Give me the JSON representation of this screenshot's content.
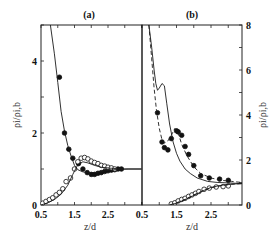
{
  "chart_data": [
    {
      "type": "scatter",
      "panel": "(a)",
      "title": "(a)",
      "xlabel": "z/d",
      "ylabel": "ρi/ρi,b",
      "xlim": [
        0.5,
        3.5
      ],
      "ylim": [
        0,
        5
      ],
      "xticks": [
        "0.5",
        "1.5",
        "2.5"
      ],
      "yticks": [
        "0",
        "2",
        "4"
      ],
      "ytick_values": [
        0,
        2,
        4
      ],
      "xtick_values": [
        0.5,
        1.5,
        2.5
      ],
      "grid": false,
      "series": [
        {
          "name": "filled-circles-data",
          "marker": "filled-circle",
          "x": [
            1.05,
            1.2,
            1.33,
            1.45,
            1.62,
            1.75,
            1.88,
            2.0,
            2.1,
            2.2,
            2.3,
            2.4,
            2.5,
            2.6,
            2.7,
            2.8,
            2.9
          ],
          "y": [
            3.55,
            2.0,
            1.55,
            1.3,
            1.15,
            1.0,
            0.9,
            0.85,
            0.85,
            0.88,
            0.9,
            0.93,
            0.95,
            0.97,
            0.98,
            1.0,
            1.0
          ]
        },
        {
          "name": "open-circles-data",
          "marker": "open-circle",
          "x": [
            0.55,
            0.65,
            0.75,
            0.85,
            0.95,
            1.05,
            1.15,
            1.25,
            1.38,
            1.5,
            1.6,
            1.7,
            1.8,
            1.9,
            2.0,
            2.1,
            2.2,
            2.3,
            2.4,
            2.5,
            2.6,
            2.7
          ],
          "y": [
            0.05,
            0.1,
            0.15,
            0.2,
            0.28,
            0.35,
            0.45,
            0.65,
            0.75,
            1.0,
            1.2,
            1.3,
            1.32,
            1.28,
            1.22,
            1.18,
            1.15,
            1.1,
            1.08,
            1.05,
            1.03,
            1.0
          ]
        },
        {
          "name": "model-solid-decreasing",
          "style": "solid",
          "x": [
            0.78,
            0.9,
            1.0,
            1.1,
            1.2,
            1.3,
            1.4,
            1.5,
            1.6,
            1.75,
            1.9,
            2.1,
            2.3,
            2.5,
            2.8,
            3.1,
            3.5
          ],
          "y": [
            5.0,
            4.2,
            3.4,
            2.6,
            2.05,
            1.65,
            1.35,
            1.1,
            0.98,
            0.92,
            0.9,
            0.9,
            0.93,
            0.96,
            0.99,
            1.0,
            1.0
          ]
        },
        {
          "name": "model-solid-increasing",
          "style": "solid",
          "x": [
            0.5,
            0.7,
            0.9,
            1.1,
            1.3,
            1.45,
            1.6,
            1.75,
            1.9,
            2.1,
            2.3,
            2.6,
            3.0,
            3.5
          ],
          "y": [
            0.0,
            0.06,
            0.15,
            0.3,
            0.55,
            0.85,
            1.12,
            1.2,
            1.17,
            1.1,
            1.05,
            1.02,
            1.0,
            1.0
          ]
        }
      ]
    },
    {
      "type": "scatter",
      "panel": "(b)",
      "title": "(b)",
      "xlabel": "z/d",
      "ylabel": "ρi/ρi,b",
      "xlim": [
        0.5,
        3.4
      ],
      "ylim": [
        0,
        8
      ],
      "xticks": [
        "0.5",
        "1.5",
        "2.5"
      ],
      "yticks": [
        "0",
        "2",
        "4",
        "6",
        "8"
      ],
      "ytick_values": [
        0,
        2,
        4,
        6,
        8
      ],
      "xtick_values": [
        0.5,
        1.5,
        2.5
      ],
      "grid": false,
      "series": [
        {
          "name": "filled-circles-data",
          "marker": "filled-circle",
          "x": [
            0.95,
            1.08,
            1.15,
            1.25,
            1.35,
            1.5,
            1.65,
            1.75,
            1.85,
            2.0,
            2.2,
            2.45,
            2.75,
            3.0
          ],
          "y": [
            4.1,
            2.8,
            2.55,
            2.45,
            2.95,
            3.3,
            3.1,
            2.6,
            2.25,
            1.75,
            1.3,
            1.2,
            1.15,
            1.1
          ],
          "extra": {
            "x": [
              1.55
            ],
            "y": [
              3.25
            ]
          }
        },
        {
          "name": "open-circles-data",
          "marker": "open-circle",
          "x": [
            1.35,
            1.45,
            1.55,
            1.65,
            1.75,
            1.85,
            1.95,
            2.05,
            2.15,
            2.3,
            2.45,
            2.65,
            2.85,
            3.0
          ],
          "y": [
            0.05,
            0.1,
            0.18,
            0.25,
            0.3,
            0.38,
            0.45,
            0.52,
            0.6,
            0.7,
            0.75,
            0.8,
            0.82,
            0.85
          ]
        },
        {
          "name": "model-solid-decreasing",
          "style": "solid",
          "x": [
            0.7,
            0.78,
            0.85,
            0.9,
            0.95,
            1.0,
            1.08,
            1.15,
            1.22,
            1.3,
            1.4,
            1.5,
            1.6,
            1.75,
            1.9,
            2.1,
            2.4,
            2.7,
            3.0,
            3.4
          ],
          "y": [
            8.0,
            7.0,
            6.0,
            5.4,
            5.1,
            5.2,
            5.4,
            5.3,
            4.5,
            3.6,
            2.8,
            2.3,
            1.95,
            1.6,
            1.4,
            1.2,
            1.05,
            1.0,
            0.98,
            0.95
          ]
        },
        {
          "name": "model-dashed-decreasing",
          "style": "dashed",
          "x": [
            0.7,
            0.78,
            0.85,
            0.92,
            1.0,
            1.08,
            1.15,
            1.25,
            1.35,
            1.45,
            1.55,
            1.65,
            1.8,
            2.0,
            2.2,
            2.5,
            2.8,
            3.1,
            3.4
          ],
          "y": [
            8.0,
            6.5,
            5.2,
            4.2,
            3.4,
            2.9,
            2.75,
            2.85,
            3.1,
            3.4,
            3.2,
            2.7,
            2.2,
            1.7,
            1.4,
            1.2,
            1.1,
            1.05,
            1.0
          ]
        },
        {
          "name": "model-solid-increasing",
          "style": "solid",
          "x": [
            1.3,
            1.5,
            1.7,
            1.9,
            2.1,
            2.3,
            2.5,
            2.7,
            2.9,
            3.1,
            3.4
          ],
          "y": [
            0.0,
            0.08,
            0.2,
            0.35,
            0.5,
            0.65,
            0.78,
            0.85,
            0.9,
            0.93,
            0.95
          ]
        },
        {
          "name": "model-dashed-increasing",
          "style": "dashed",
          "x": [
            1.3,
            1.5,
            1.7,
            1.9,
            2.1,
            2.3,
            2.5,
            2.7,
            2.9,
            3.1,
            3.4
          ],
          "y": [
            0.0,
            0.1,
            0.22,
            0.37,
            0.52,
            0.66,
            0.76,
            0.83,
            0.88,
            0.92,
            0.95
          ]
        }
      ]
    }
  ],
  "labels": {
    "panel_a": "(a)",
    "panel_b": "(b)",
    "xlabel_a": "z/d",
    "xlabel_b": "z/d",
    "ylabel_left": "ρi/ρi,b",
    "ylabel_right": "ρi/ρi,b"
  },
  "colors": {
    "line": "#1a1a1a",
    "marker": "#111111",
    "frame": "#222222"
  }
}
